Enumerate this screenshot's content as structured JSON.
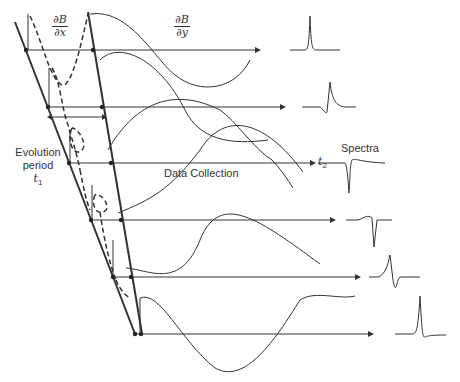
{
  "labels": {
    "dBdx": {
      "num": "∂B",
      "den": "∂x"
    },
    "dBdy": {
      "num": "∂B",
      "den": "∂y"
    },
    "evolution": {
      "line1": "Evolution",
      "line2": "period",
      "var": "t",
      "sub": "1"
    },
    "data_collection": "Data Collection",
    "t2": {
      "var": "t",
      "sub": "2"
    },
    "spectra": "Spectra"
  },
  "geometry": {
    "arrow_rows_y": [
      50,
      107,
      163,
      220,
      277,
      334
    ],
    "left_line": {
      "x1": 15,
      "y1": 22,
      "x2": 135,
      "y2": 334
    },
    "right_line": {
      "x1": 88,
      "y1": 12,
      "x2": 142,
      "y2": 334
    }
  },
  "spectra_shapes": [
    "absorption-positive",
    "dispersive-positive",
    "absorption-negative",
    "dispersive-negative",
    "dispersive-mixed",
    "absorption-positive"
  ],
  "colors": {
    "ink": "#333333",
    "background": "#ffffff"
  }
}
